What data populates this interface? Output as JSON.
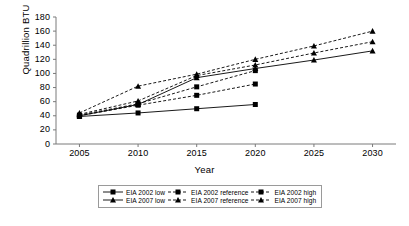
{
  "chart_data": {
    "type": "line",
    "title": "",
    "xlabel": "Year",
    "ylabel": "Quadrillion BTU",
    "x": [
      2005,
      2010,
      2015,
      2020,
      2025,
      2030
    ],
    "xlim": [
      2003,
      2032
    ],
    "ylim": [
      0,
      180
    ],
    "ytick_step": 20,
    "xtick_labels": [
      "2005",
      "2010",
      "2015",
      "2020",
      "2025",
      "2030"
    ],
    "ytick_labels": [
      "0",
      "20",
      "40",
      "60",
      "80",
      "100",
      "120",
      "140",
      "160",
      "180"
    ],
    "grid": false,
    "legend_position": "bottom",
    "series": [
      {
        "name": "EIA 2002 low",
        "marker": "square",
        "line": "solid",
        "x": [
          2005,
          2010,
          2015,
          2020
        ],
        "values": [
          39,
          44,
          50,
          56
        ]
      },
      {
        "name": "EIA 2002 reference",
        "marker": "square",
        "line": "dashed",
        "x": [
          2005,
          2010,
          2015,
          2020
        ],
        "values": [
          40,
          55,
          69,
          85
        ]
      },
      {
        "name": "EIA 2002 high",
        "marker": "square",
        "line": "dashed",
        "x": [
          2005,
          2010,
          2015,
          2020
        ],
        "values": [
          41,
          57,
          81,
          104
        ]
      },
      {
        "name": "EIA 2007 low",
        "marker": "triangle",
        "line": "solid",
        "x": [
          2005,
          2010,
          2015,
          2020,
          2025,
          2030
        ],
        "values": [
          40,
          56,
          94,
          107,
          119,
          132
        ]
      },
      {
        "name": "EIA 2007 reference",
        "marker": "triangle",
        "line": "dashed",
        "x": [
          2005,
          2010,
          2015,
          2020,
          2025,
          2030
        ],
        "values": [
          42,
          61,
          97,
          112,
          129,
          145
        ]
      },
      {
        "name": "EIA 2007 high",
        "marker": "triangle",
        "line": "dashed",
        "x": [
          2005,
          2010,
          2015,
          2020,
          2025,
          2030
        ],
        "values": [
          44,
          82,
          99,
          120,
          139,
          160
        ]
      }
    ]
  },
  "legend": {
    "rows": [
      [
        {
          "label": "EIA 2002 low",
          "marker": "square",
          "line": "solid"
        },
        {
          "label": "EIA 2002 reference",
          "marker": "square",
          "line": "dashed"
        },
        {
          "label": "EIA 2002 high",
          "marker": "square",
          "line": "dashed"
        }
      ],
      [
        {
          "label": "EIA 2007 low",
          "marker": "triangle",
          "line": "solid"
        },
        {
          "label": "EIA 2007 reference",
          "marker": "triangle",
          "line": "dashed"
        },
        {
          "label": "EIA 2007 high",
          "marker": "triangle",
          "line": "dashed"
        }
      ]
    ]
  },
  "colors": {
    "ink": "#000000",
    "axis": "#7a7a7a",
    "legend_border": "#9a9a9a",
    "background": "#ffffff"
  }
}
